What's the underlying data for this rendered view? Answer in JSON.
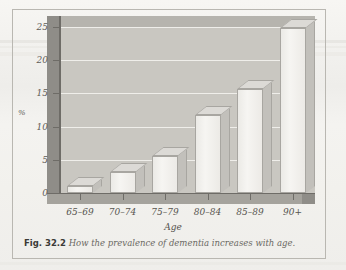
{
  "figure": {
    "caption_label": "Fig. 32.2",
    "caption_text": "How the prevalence of dementia increases with age."
  },
  "chart_data": {
    "type": "bar",
    "title": "",
    "subtitle": "",
    "categories": [
      "65–69",
      "70–74",
      "75–79",
      "80–84",
      "85–89",
      "90+"
    ],
    "values": [
      1.0,
      3.2,
      5.5,
      11.8,
      15.7,
      24.8
    ],
    "xlabel": "Age",
    "ylabel": "%",
    "ylim": [
      0,
      25
    ],
    "yticks": [
      0,
      5,
      10,
      15,
      20,
      25
    ],
    "ytick_labels": [
      "0",
      "5",
      "10",
      "15",
      "20",
      "25"
    ],
    "grid": true,
    "legend": "none",
    "style": "3d-bar",
    "colors": {
      "bar_face": "#f2f1ed",
      "bar_side": "#c2c0bb",
      "bar_top": "#dcdad6",
      "plot_back": "#c9c7c1",
      "plot_floor": "#a5a39d",
      "plot_left_wall": "#8f8d88",
      "gridline": "#f2f1ee",
      "axis": "#6e6c67",
      "page": "#f3f2ef",
      "border": "#b9b7b1",
      "text": "#56544f"
    }
  }
}
